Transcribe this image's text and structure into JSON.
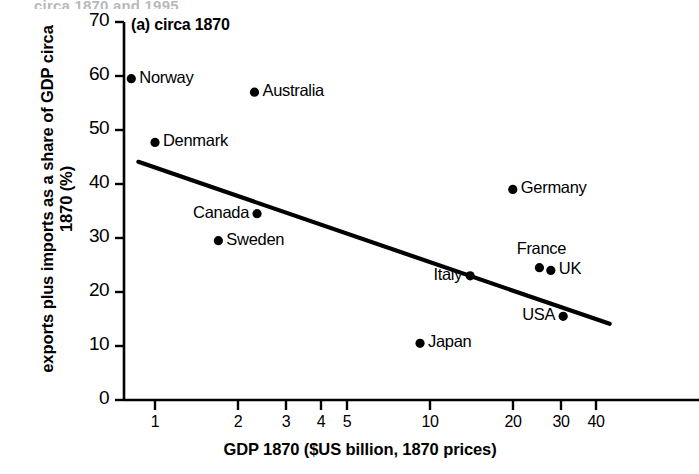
{
  "figure": {
    "panel_title": "(a) circa 1870",
    "top_cropped_caption": "circa 1870 and 1995",
    "line_color": "#000000",
    "point_color": "#000000",
    "axis_color": "#000000",
    "background": "#ffffff"
  },
  "chart_data": {
    "type": "scatter",
    "title": "(a) circa 1870",
    "xlabel": "GDP 1870 ($US billion, 1870 prices)",
    "ylabel": "exports plus imports as a share of GDP circa 1870 (%)",
    "xscale": "log",
    "yscale": "linear",
    "xlim": [
      0.7,
      48
    ],
    "ylim": [
      0,
      70
    ],
    "xticks": [
      1,
      2,
      3,
      4,
      5,
      10,
      20,
      30,
      40
    ],
    "xtick_labels": [
      "1",
      "2",
      "3",
      "4",
      "5",
      "10",
      "20",
      "30",
      "40"
    ],
    "yticks": [
      0,
      10,
      20,
      30,
      40,
      50,
      60,
      70
    ],
    "ytick_labels": [
      "0",
      "10",
      "20",
      "30",
      "40",
      "50",
      "60",
      "70"
    ],
    "grid": false,
    "legend": false,
    "points": [
      {
        "label": "Norway",
        "x": 0.82,
        "y": 59.5,
        "label_side": "right"
      },
      {
        "label": "Australia",
        "x": 2.3,
        "y": 57.0,
        "label_side": "right"
      },
      {
        "label": "Denmark",
        "x": 1.0,
        "y": 47.7,
        "label_side": "right"
      },
      {
        "label": "Germany",
        "x": 20.0,
        "y": 39.0,
        "label_side": "right"
      },
      {
        "label": "Canada",
        "x": 2.35,
        "y": 34.5,
        "label_side": "left"
      },
      {
        "label": "Sweden",
        "x": 1.7,
        "y": 29.5,
        "label_side": "right"
      },
      {
        "label": "France",
        "x": 25.0,
        "y": 24.5,
        "label_side": "above"
      },
      {
        "label": "UK",
        "x": 27.5,
        "y": 24.0,
        "label_side": "right"
      },
      {
        "label": "Italy",
        "x": 14.0,
        "y": 23.0,
        "label_side": "left"
      },
      {
        "label": "USA",
        "x": 30.5,
        "y": 15.5,
        "label_side": "left"
      },
      {
        "label": "Japan",
        "x": 9.2,
        "y": 10.5,
        "label_side": "right"
      }
    ],
    "trendline": {
      "description": "downward-sloping fitted regression line",
      "x_start": 0.87,
      "y_start": 44.1,
      "x_end": 45.0,
      "y_end": 14.1
    }
  },
  "ticks": {
    "y": [
      {
        "value": 70,
        "label": "70",
        "px": 22
      },
      {
        "value": 60,
        "label": "60",
        "px": 76
      },
      {
        "value": 50,
        "label": "50",
        "px": 130
      },
      {
        "value": 40,
        "label": "40",
        "px": 184
      },
      {
        "value": 30,
        "label": "30",
        "px": 238
      },
      {
        "value": 20,
        "label": "20",
        "px": 292
      },
      {
        "value": 10,
        "label": "10",
        "px": 346
      },
      {
        "value": 0,
        "label": "0",
        "px": 400
      }
    ],
    "x": [
      {
        "value": 1,
        "label": "1",
        "px": 155
      },
      {
        "value": 2,
        "label": "2",
        "px": 238
      },
      {
        "value": 3,
        "label": "3",
        "px": 286
      },
      {
        "value": 4,
        "label": "4",
        "px": 321
      },
      {
        "value": 5,
        "label": "5",
        "px": 347
      },
      {
        "value": 10,
        "label": "10",
        "px": 430
      },
      {
        "value": 20,
        "label": "20",
        "px": 513
      },
      {
        "value": 30,
        "label": "30",
        "px": 561
      },
      {
        "value": 40,
        "label": "40",
        "px": 596
      }
    ]
  }
}
